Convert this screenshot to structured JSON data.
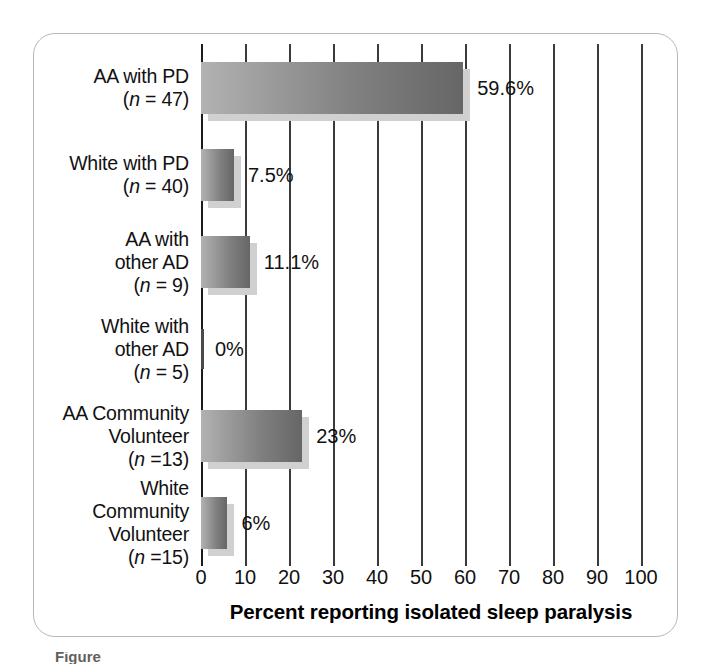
{
  "chart_data": {
    "type": "bar",
    "orientation": "horizontal",
    "title": "",
    "xlabel": "Percent reporting isolated sleep paralysis",
    "ylabel": "",
    "xlim": [
      0,
      100
    ],
    "xticks": [
      0,
      10,
      20,
      30,
      40,
      50,
      60,
      70,
      80,
      90,
      100
    ],
    "xtick_labels": [
      "0",
      "10",
      "20",
      "30",
      "40",
      "50",
      "60",
      "70",
      "80",
      "90",
      "100"
    ],
    "grid": true,
    "grid_axis": "x",
    "legend": false,
    "categories": [
      "AA with PD (n = 47)",
      "White with PD (n = 40)",
      "AA with other AD (n = 9)",
      "White with other AD (n = 5)",
      "AA Community Volunteer (n =13)",
      "White Community Volunteer (n =15)"
    ],
    "values": [
      59.6,
      7.5,
      11.1,
      0,
      23,
      6
    ],
    "value_labels": [
      "59.6%",
      "7.5%",
      "11.1%",
      "0%",
      "23%",
      "6%"
    ],
    "bars": [
      {
        "line1": "AA with PD",
        "line2": "",
        "line3": "",
        "n_prefix": "(",
        "n_italic": "n",
        "n_rest": " = 47)",
        "value": 59.6,
        "label": "59.6%"
      },
      {
        "line1": "White with PD",
        "line2": "",
        "line3": "",
        "n_prefix": "(",
        "n_italic": "n",
        "n_rest": " = 40)",
        "value": 7.5,
        "label": "7.5%"
      },
      {
        "line1": "AA with",
        "line2": "other AD",
        "line3": "",
        "n_prefix": "(",
        "n_italic": "n",
        "n_rest": " = 9)",
        "value": 11.1,
        "label": "11.1%"
      },
      {
        "line1": "White with",
        "line2": "other AD",
        "line3": "",
        "n_prefix": "(",
        "n_italic": "n",
        "n_rest": " = 5)",
        "value": 0,
        "label": "0%"
      },
      {
        "line1": "AA Community",
        "line2": "Volunteer",
        "line3": "",
        "n_prefix": "(",
        "n_italic": "n",
        "n_rest": " =13)",
        "value": 23,
        "label": "23%"
      },
      {
        "line1": "White",
        "line2": "Community",
        "line3": "Volunteer",
        "n_prefix": "(",
        "n_italic": "n",
        "n_rest": " =15)",
        "value": 6,
        "label": "6%"
      }
    ],
    "colors": {
      "bar_gradient_start": "#b2b2b2",
      "bar_gradient_end": "#666666",
      "bar_shadow": "#d0d0d0",
      "gridline": "#3a3a3a",
      "axis": "#1b1b1b",
      "text": "#111111",
      "frame_border": "#b9b9b9",
      "background": "#ffffff"
    }
  },
  "caption_sliver": "Figure"
}
